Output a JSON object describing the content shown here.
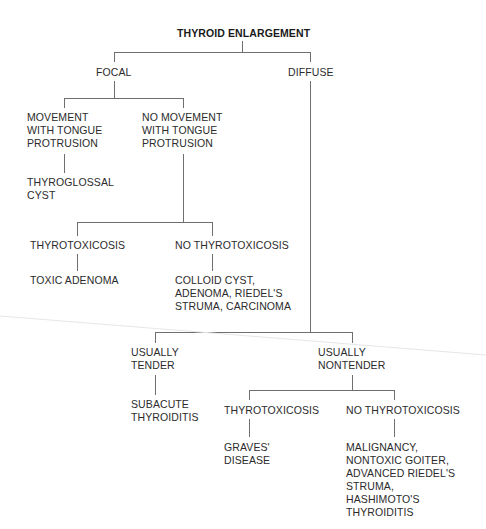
{
  "diagram": {
    "title": "THYROID ENLARGEMENT",
    "nodes": {
      "focal": "FOCAL",
      "diffuse": "DIFFUSE",
      "movement": "MOVEMENT\nWITH TONGUE\nPROTRUSION",
      "no_movement": "NO MOVEMENT\nWITH TONGUE\nPROTRUSION",
      "thyroglossal_cyst": "THYROGLOSSAL\nCYST",
      "focal_thyrotoxicosis": "THYROTOXICOSIS",
      "focal_no_thyrotoxicosis": "NO THYROTOXICOSIS",
      "toxic_adenoma": "TOXIC ADENOMA",
      "colloid_cyst": "COLLOID CYST,\nADENOMA, RIEDEL'S\nSTRUMA, CARCINOMA",
      "usually_tender": "USUALLY\nTENDER",
      "usually_nontender": "USUALLY\nNONTENDER",
      "subacute_thyroiditis": "SUBACUTE\nTHYROIDITIS",
      "diffuse_thyrotoxicosis": "THYROTOXICOSIS",
      "diffuse_no_thyrotoxicosis": "NO THYROTOXICOSIS",
      "graves_disease": "GRAVES'\nDISEASE",
      "malignancy": "MALIGNANCY,\nNONTOXIC GOITER,\nADVANCED RIEDEL'S\nSTRUMA,\nHASHIMOTO'S\nTHYROIDITIS"
    },
    "colors": {
      "text": "#2b2b2b",
      "line": "#6f6f6f",
      "background": "#ffffff"
    }
  }
}
